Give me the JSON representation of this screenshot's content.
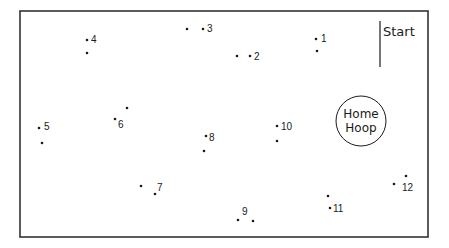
{
  "diagram": {
    "type": "orienteering-course",
    "border": {
      "x": 20,
      "y": 11,
      "width": 408,
      "height": 226,
      "color": "#333333"
    },
    "start": {
      "label": "Start",
      "line": {
        "x": 380,
        "y1": 21,
        "y2": 67
      }
    },
    "home": {
      "label_line1": "Home",
      "label_line2": "Hoop",
      "cx": 361,
      "cy": 121,
      "r": 25
    },
    "gates": [
      {
        "id": "1",
        "label": "1",
        "a": [
          316,
          39
        ],
        "b": [
          317,
          51
        ],
        "label_pos": [
          321,
          42
        ]
      },
      {
        "id": "2",
        "label": "2",
        "a": [
          237,
          56
        ],
        "b": [
          250,
          56
        ],
        "label_pos": [
          254,
          60
        ]
      },
      {
        "id": "3",
        "label": "3",
        "a": [
          187,
          29
        ],
        "b": [
          203,
          29
        ],
        "label_pos": [
          207,
          32
        ]
      },
      {
        "id": "4",
        "label": "4",
        "a": [
          87,
          40
        ],
        "b": [
          87,
          53
        ],
        "label_pos": [
          91,
          43
        ]
      },
      {
        "id": "5",
        "label": "5",
        "a": [
          39,
          128
        ],
        "b": [
          42,
          143
        ],
        "label_pos": [
          44,
          130
        ]
      },
      {
        "id": "6",
        "label": "6",
        "a": [
          115,
          119
        ],
        "b": [
          127,
          108
        ],
        "label_pos": [
          118,
          128
        ]
      },
      {
        "id": "7",
        "label": "7",
        "a": [
          141,
          186
        ],
        "b": [
          155,
          194
        ],
        "label_pos": [
          157,
          191
        ]
      },
      {
        "id": "8",
        "label": "8",
        "a": [
          206,
          136
        ],
        "b": [
          204,
          151
        ],
        "label_pos": [
          209,
          141
        ]
      },
      {
        "id": "9",
        "label": "9",
        "a": [
          238,
          220
        ],
        "b": [
          253,
          221
        ],
        "label_pos": [
          242,
          215
        ]
      },
      {
        "id": "10",
        "label": "10",
        "a": [
          277,
          126
        ],
        "b": [
          277,
          141
        ],
        "label_pos": [
          281,
          130
        ]
      },
      {
        "id": "11",
        "label": "11",
        "a": [
          328,
          196
        ],
        "b": [
          330,
          208
        ],
        "label_pos": [
          333,
          212
        ]
      },
      {
        "id": "12",
        "label": "12",
        "a": [
          394,
          184
        ],
        "b": [
          406,
          176
        ],
        "label_pos": [
          402,
          191
        ]
      }
    ]
  }
}
